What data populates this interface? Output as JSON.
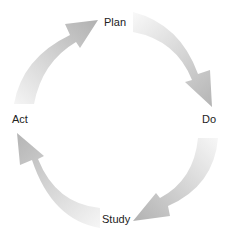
{
  "diagram": {
    "type": "cycle",
    "stages": [
      {
        "id": "plan",
        "label": "Plan"
      },
      {
        "id": "do",
        "label": "Do"
      },
      {
        "id": "study",
        "label": "Study"
      },
      {
        "id": "act",
        "label": "Act"
      }
    ],
    "arrows": [
      {
        "from": "act",
        "to": "plan"
      },
      {
        "from": "plan",
        "to": "do"
      },
      {
        "from": "do",
        "to": "study"
      },
      {
        "from": "study",
        "to": "act"
      }
    ],
    "colors": {
      "arrow_head": "#b5b5b5",
      "arrow_tail": "#f4f4f4",
      "label": "#222222",
      "background": "#ffffff"
    }
  }
}
